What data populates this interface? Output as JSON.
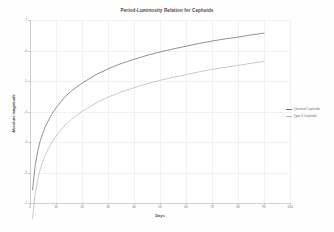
{
  "chart_data": {
    "type": "line",
    "title": "Period-Luminosity Relation for Cepheids",
    "xlabel": "Days",
    "ylabel": "Absolute magnitude",
    "xlim": [
      0,
      100
    ],
    "ylim": [
      -7,
      -1
    ],
    "grid": true,
    "legend_position": "right",
    "x_ticks": [
      "0",
      "10",
      "20",
      "30",
      "40",
      "50",
      "60",
      "70",
      "80",
      "90",
      "100"
    ],
    "x_tick_values": [
      0,
      10,
      20,
      30,
      40,
      50,
      60,
      70,
      80,
      90,
      100
    ],
    "y_ticks": [
      "-7",
      "-6",
      "-5",
      "-4",
      "-3",
      "-2",
      "-1"
    ],
    "y_tick_values": [
      -7,
      -6,
      -5,
      -4,
      -3,
      -2,
      -1
    ],
    "x": [
      1,
      2,
      3,
      4,
      5,
      6,
      8,
      10,
      13,
      16,
      20,
      25,
      30,
      35,
      40,
      45,
      50,
      55,
      60,
      65,
      70,
      75,
      80,
      85,
      90
    ],
    "series": [
      {
        "name": "Classical Cepheids",
        "color": "#6e6e73",
        "values": [
          -1.43,
          -2.24,
          -2.71,
          -3.05,
          -3.31,
          -3.52,
          -3.86,
          -4.12,
          -4.44,
          -4.68,
          -4.93,
          -5.19,
          -5.4,
          -5.57,
          -5.71,
          -5.84,
          -5.95,
          -6.05,
          -6.14,
          -6.23,
          -6.31,
          -6.38,
          -6.44,
          -6.51,
          -6.57
        ]
      },
      {
        "name": "Type II Cepheids",
        "color": "#b9b9bd",
        "values": [
          -0.5,
          -1.31,
          -1.78,
          -2.12,
          -2.38,
          -2.59,
          -2.93,
          -3.19,
          -3.51,
          -3.75,
          -4.0,
          -4.26,
          -4.47,
          -4.64,
          -4.78,
          -4.91,
          -5.02,
          -5.12,
          -5.21,
          -5.3,
          -5.38,
          -5.45,
          -5.51,
          -5.58,
          -5.64
        ]
      }
    ],
    "legend": [
      "Classical Cepheids",
      "Type II Cepheids"
    ]
  }
}
